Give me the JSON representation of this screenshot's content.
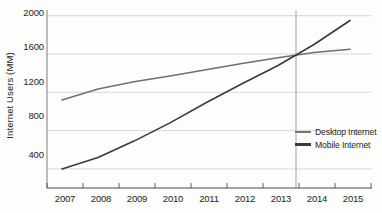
{
  "chart_data": {
    "type": "line",
    "title": "",
    "xlabel": "",
    "ylabel": "Internet Users (MM)",
    "categories": [
      "2007",
      "2008",
      "2009",
      "2010",
      "2011",
      "2012",
      "2013",
      "2014",
      "2015"
    ],
    "x": [
      2007,
      2008,
      2009,
      2010,
      2011,
      2012,
      2013,
      2014,
      2015
    ],
    "ylim": [
      200,
      2060
    ],
    "xlim": [
      2006.6,
      2015.4
    ],
    "yticks": [
      400,
      800,
      1200,
      1600,
      2000
    ],
    "ytick_labels": [
      "400",
      "800",
      "1200",
      "1600",
      "2000"
    ],
    "grid": "horizontal",
    "legend_position": "bottom-right",
    "series": [
      {
        "name": "Desktop Internet",
        "color": "#6f6f6e",
        "values": [
          1120,
          1235,
          1310,
          1370,
          1435,
          1500,
          1560,
          1615,
          1650
        ]
      },
      {
        "name": "Mobile Internet",
        "color": "#3a3a3a",
        "values": [
          400,
          520,
          690,
          880,
          1090,
          1290,
          1480,
          1700,
          1950
        ]
      }
    ],
    "annotations": [
      {
        "type": "vertical-reference-line",
        "x": 2013.5,
        "label": ""
      }
    ]
  },
  "axis": {
    "y_title": "Internet Users (MM)",
    "y_ticks": [
      "2000",
      "1600",
      "1200",
      "800",
      "400"
    ],
    "x_ticks": [
      "2007",
      "2008",
      "2009",
      "2010",
      "2011",
      "2012",
      "2013",
      "2014",
      "2015"
    ]
  },
  "legend": {
    "items": [
      {
        "label": "Desktop Internet",
        "key": "desktop"
      },
      {
        "label": "Mobile Internet",
        "key": "mobile"
      }
    ]
  },
  "colors": {
    "desktop_line": "#6f6f6e",
    "mobile_line": "#3a3a3a",
    "gridline": "#c9c9c7",
    "axis": "#4a4a4a",
    "reference_line": "#8d8d8c",
    "background": "#fdfdfc"
  }
}
